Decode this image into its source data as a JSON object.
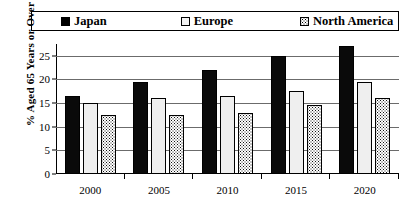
{
  "chart_data": {
    "type": "bar",
    "title": "",
    "xlabel": "",
    "ylabel": "% Aged 65 Years or Over",
    "categories": [
      "2000",
      "2005",
      "2010",
      "2015",
      "2020"
    ],
    "series": [
      {
        "name": "Japan",
        "swatch": "solid-black",
        "color": "#000000",
        "values": [
          16.5,
          19.5,
          22.0,
          25.0,
          27.0
        ]
      },
      {
        "name": "Europe",
        "swatch": "white-outline",
        "color": "#efefef",
        "values": [
          15.0,
          16.0,
          16.5,
          17.5,
          19.5
        ]
      },
      {
        "name": "North America",
        "swatch": "dotted-pattern",
        "color": "#ffffff",
        "values": [
          12.5,
          12.5,
          13.0,
          14.5,
          16.0
        ]
      }
    ],
    "ylim": [
      0,
      27.5
    ],
    "yticks": [
      0,
      5,
      10,
      15,
      20,
      25
    ],
    "ytick_labels": [
      "0",
      "5",
      "10",
      "15",
      "20",
      "25"
    ],
    "grid": true,
    "legend_position": "top"
  }
}
